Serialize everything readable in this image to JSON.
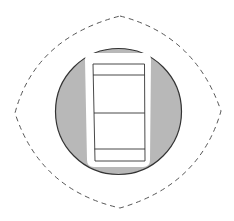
{
  "diagram": {
    "type": "rocker-switch-plate",
    "colors": {
      "background": "#ffffff",
      "outline_dashed": "#555555",
      "plate_fill": "#b8b8b8",
      "plate_stroke": "#333333",
      "frame_fill": "#ffffff",
      "rocker_stroke": "#333333"
    },
    "outer_boundary": {
      "style": "dashed",
      "tips": {
        "top": [
          120,
          16
        ],
        "right": [
          221,
          111
        ],
        "bottom": [
          120,
          208
        ],
        "left": [
          15,
          113
        ]
      }
    },
    "plate": {
      "shape": "circle",
      "center": [
        118.5,
        111.5
      ],
      "radius": 63
    },
    "rocker": {
      "frame": {
        "x": 85,
        "y": 53,
        "width": 66,
        "height": 115
      },
      "body": {
        "x": 93,
        "y": 64,
        "width": 52,
        "height": 97
      },
      "divider_lines_y": [
        75,
        113,
        149
      ]
    }
  }
}
